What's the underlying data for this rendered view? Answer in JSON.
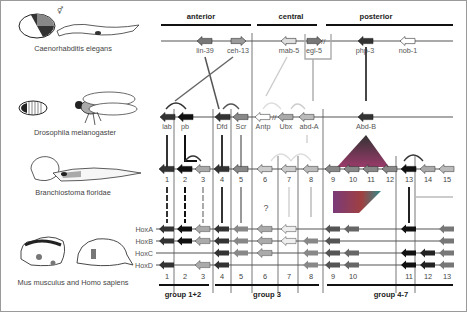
{
  "diagram": {
    "type": "hox-gene-cluster-evolution",
    "regions": [
      "anterior",
      "central",
      "posterior"
    ],
    "species": [
      {
        "name": "Caenorhabditis elegans"
      },
      {
        "name": "Drosophila melanogaster"
      },
      {
        "name": "Branchiostoma floridae"
      },
      {
        "name": "Mus musculus and Homo sapiens"
      }
    ],
    "celegans_genes": [
      "lin-39",
      "ceh-13",
      "mab-5",
      "egl-5",
      "php-3",
      "nob-1"
    ],
    "drosophila_genes": [
      "lab",
      "pb",
      "Dfd",
      "Scr",
      "Antp",
      "Ubx",
      "abd-A",
      "Abd-B"
    ],
    "amphioxus_numbers": [
      "1",
      "2",
      "3",
      "4",
      "5",
      "6",
      "7",
      "8",
      "9",
      "10",
      "11",
      "12",
      "13",
      "14",
      "15"
    ],
    "vertebrate_clusters": [
      "HoxA",
      "HoxB",
      "HoxC",
      "HoxD"
    ],
    "vertebrate_numbers": [
      "1",
      "2",
      "3",
      "4",
      "5",
      "6",
      "7",
      "8",
      "9",
      "10",
      "11",
      "12",
      "13"
    ],
    "unknown_mark": "?",
    "groups": [
      "group 1+2",
      "group 3",
      "group 4-7"
    ]
  }
}
